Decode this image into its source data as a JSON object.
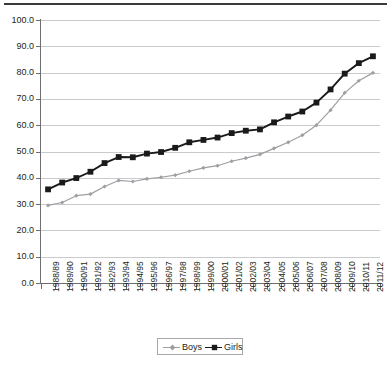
{
  "chart_data": {
    "type": "line",
    "title": "",
    "subtitle": "",
    "xlabel": "",
    "ylabel": "",
    "ylim": [
      0.0,
      100.0
    ],
    "ytick_labels": [
      "100.0",
      "90.0",
      "80.0",
      "70.0",
      "60.0",
      "50.0",
      "40.0",
      "30.0",
      "20.0",
      "10.0",
      "0.0"
    ],
    "ytick_values": [
      100.0,
      90.0,
      80.0,
      70.0,
      60.0,
      50.0,
      40.0,
      30.0,
      20.0,
      10.0,
      0.0
    ],
    "grid": true,
    "legend_position": "bottom-center",
    "categories": [
      "1988/89",
      "1989/90",
      "1990/91",
      "1991/92",
      "1992/93",
      "1993/94",
      "1994/95",
      "1995/96",
      "1996/97",
      "1997/98",
      "1998/99",
      "1999/00",
      "2000/01",
      "2001/02",
      "2002/03",
      "2003/04",
      "2004/05",
      "2005/06",
      "2006/07",
      "2007/08",
      "2008/09",
      "2009/10",
      "2010/11",
      "2011/12"
    ],
    "series": [
      {
        "name": "Boys",
        "color": "#9d9fa2",
        "marker": "diamond",
        "values": [
          29.5,
          30.6,
          33.2,
          33.8,
          36.7,
          39.0,
          38.6,
          39.6,
          40.2,
          41.0,
          42.5,
          43.8,
          44.6,
          46.3,
          47.5,
          48.9,
          51.2,
          53.5,
          56.2,
          60.0,
          65.7,
          72.3,
          76.9,
          79.9
        ]
      },
      {
        "name": "Girls",
        "color": "#1a1a1a",
        "marker": "square",
        "values": [
          35.6,
          38.2,
          39.9,
          42.3,
          45.6,
          47.9,
          47.8,
          49.2,
          49.8,
          51.4,
          53.5,
          54.4,
          55.3,
          57.0,
          57.9,
          58.4,
          61.1,
          63.3,
          65.2,
          68.6,
          73.6,
          79.6,
          83.6,
          86.2
        ]
      }
    ]
  },
  "legend": {
    "entries": [
      {
        "label": "Boys"
      },
      {
        "label": "Girls"
      }
    ]
  }
}
